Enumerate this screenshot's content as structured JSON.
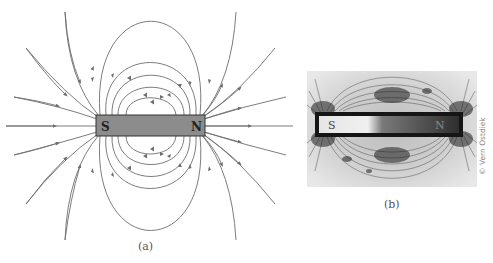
{
  "figure_a": {
    "caption": "(a)",
    "magnet": {
      "south_label": "S",
      "north_label": "N",
      "fill": "#8c8c8c",
      "stroke": "#333333"
    },
    "line_color": "#6e6e6e"
  },
  "figure_b": {
    "caption": "(b)",
    "magnet": {
      "south_label": "S",
      "north_label": "N"
    },
    "credit": "© Vern Ostdiek"
  }
}
